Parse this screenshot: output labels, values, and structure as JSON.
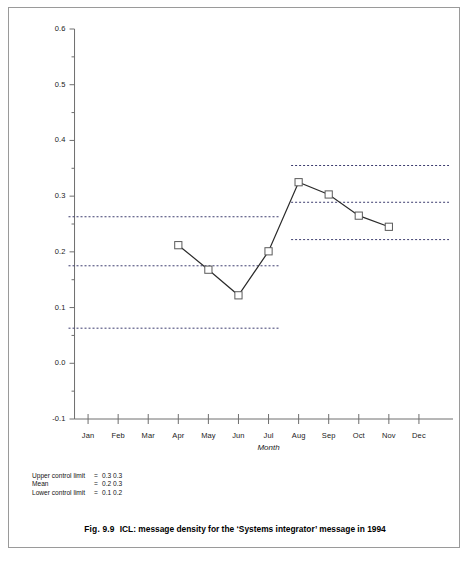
{
  "figure": {
    "caption_number": "Fig. 9.9",
    "caption_text": "ICL: message density for the ‘Systems integrator’ message in 1994"
  },
  "limits_block": {
    "rows": [
      {
        "name": "Upper control limit",
        "eq": "=",
        "values": "0.3 0.3"
      },
      {
        "name": "Mean",
        "eq": "=",
        "values": "0.2 0.3"
      },
      {
        "name": "Lower control limit",
        "eq": "=",
        "values": "0.1 0.2"
      }
    ]
  },
  "chart_data": {
    "type": "line",
    "title": "",
    "xlabel": "Month",
    "ylabel": "",
    "xlim": [
      0,
      13
    ],
    "ylim": [
      -0.1,
      0.6
    ],
    "grid": false,
    "legend": "none",
    "categories": [
      "Jan",
      "Feb",
      "Mar",
      "Apr",
      "May",
      "Jun",
      "Jul",
      "Aug",
      "Sep",
      "Oct",
      "Nov",
      "Dec"
    ],
    "y_ticks": [
      "-0.1",
      "0.0",
      "0.1",
      "0.2",
      "0.3",
      "0.4",
      "0.5",
      "0.6"
    ],
    "y_tick_values": [
      -0.1,
      0.0,
      0.1,
      0.2,
      0.3,
      0.4,
      0.5,
      0.6
    ],
    "y_minor_tick_values": [
      -0.05,
      0.05,
      0.15,
      0.25,
      0.35,
      0.45,
      0.55
    ],
    "series": [
      {
        "name": "message density",
        "marker": "open-square",
        "x": [
          "Apr",
          "May",
          "Jun",
          "Jul",
          "Aug",
          "Sep",
          "Oct",
          "Nov"
        ],
        "x_index": [
          4,
          5,
          6,
          7,
          8,
          9,
          10,
          11
        ],
        "values": [
          0.212,
          0.168,
          0.122,
          0.201,
          0.325,
          0.303,
          0.265,
          0.245
        ]
      }
    ],
    "control_limits": [
      {
        "segment": "period-1",
        "x_start_index": 0.35,
        "x_end_index": 7.35,
        "upper_control_limit": 0.263,
        "mean": 0.175,
        "lower_control_limit": 0.063
      },
      {
        "segment": "period-2",
        "x_start_index": 7.75,
        "x_end_index": 13.0,
        "upper_control_limit": 0.355,
        "mean": 0.289,
        "lower_control_limit": 0.222
      }
    ],
    "annotations": []
  },
  "colors": {
    "series_line": "#2a2a2a",
    "marker_stroke": "#5a5a5a",
    "limit_line": "#3c3c6e",
    "axis": "#6e6e6e",
    "frame": "#9a9a9a",
    "text": "#141414"
  }
}
